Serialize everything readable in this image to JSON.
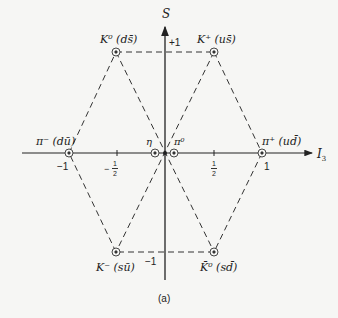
{
  "diagram": {
    "caption": "(a)",
    "axes": {
      "vertical": {
        "label": "S",
        "ticks": [
          {
            "label": "+1"
          },
          {
            "label": "−1"
          }
        ]
      },
      "horizontal": {
        "label": "I",
        "label_sub": "3",
        "ticks": [
          {
            "label": "−1"
          },
          {
            "sign": "−",
            "num": "1",
            "den": "2"
          },
          {
            "num": "1",
            "den": "2"
          },
          {
            "label": "1"
          }
        ]
      }
    },
    "particles": [
      {
        "id": "K0",
        "label": "K⁰ (ds̄)",
        "I3": -0.5,
        "S": 1
      },
      {
        "id": "Kplus",
        "label": "K⁺ (us̄)",
        "I3": 0.5,
        "S": 1
      },
      {
        "id": "piminus",
        "label": "π⁻ (dū)",
        "I3": -1,
        "S": 0
      },
      {
        "id": "eta",
        "label": "η",
        "I3": 0,
        "S": 0
      },
      {
        "id": "pi0",
        "label": "π⁰",
        "I3": 0,
        "S": 0
      },
      {
        "id": "piplus",
        "label": "π⁺ (ud̄)",
        "I3": 1,
        "S": 0
      },
      {
        "id": "Kminus",
        "label": "K⁻ (sū)",
        "I3": -0.5,
        "S": -1
      },
      {
        "id": "K0bar",
        "label": "K̄⁰ (sd̄)",
        "I3": 0.5,
        "S": -1
      }
    ],
    "marker_symbol": "⊗",
    "colors": {
      "line": "#333333",
      "background": "#f6f6f4"
    }
  }
}
